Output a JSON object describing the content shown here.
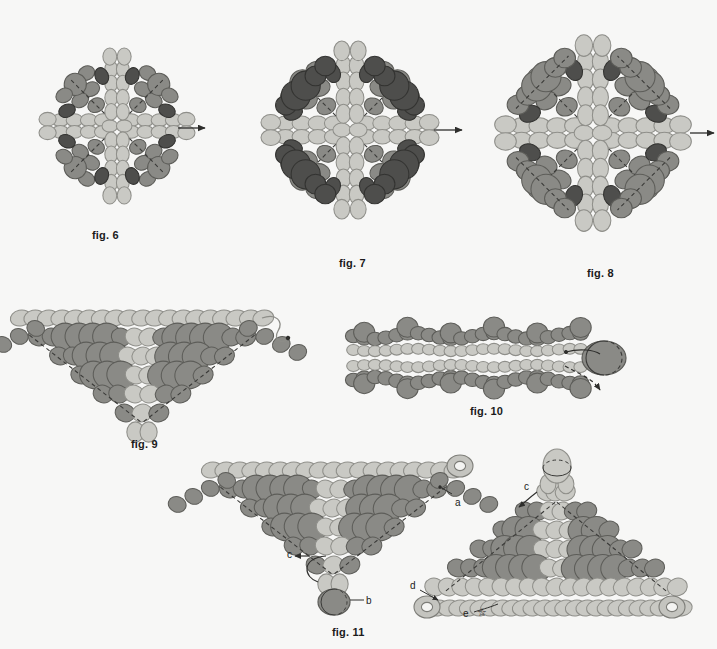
{
  "page": {
    "background_color": "#f7f7f6",
    "kind": "beadwork-instruction-diagram",
    "figure_count": 6
  },
  "palette": {
    "bead_light": "#c9c9c4",
    "bead_light_stroke": "#8f8f8a",
    "bead_medium": "#8a8a86",
    "bead_medium_stroke": "#5d5d59",
    "bead_dark": "#4e4e4c",
    "bead_dark_stroke": "#333331",
    "bead_pale": "#d9d9d4",
    "thread_color": "#3a3a38",
    "label_color": "#1b1b1b"
  },
  "figures": [
    {
      "id": "fig6",
      "label": "fig. 6",
      "shape": "diamond",
      "label_x": 92,
      "label_y": 229,
      "center_x": 117,
      "center_y": 126,
      "size": 100,
      "has_exit_arrow": true,
      "arrow_side": "right",
      "description": "Small beaded diamond with light center, medium accent beads and dark corner beads; working thread exits right."
    },
    {
      "id": "fig7",
      "label": "fig. 7",
      "shape": "diamond",
      "label_x": 339,
      "label_y": 257,
      "center_x": 350,
      "center_y": 130,
      "size": 118,
      "has_exit_arrow": true,
      "arrow_side": "right",
      "description": "Diamond enlarged by a round of large dark beads around the outer edge; thread exits right."
    },
    {
      "id": "fig8",
      "label": "fig. 8",
      "shape": "diamond",
      "label_x": 587,
      "label_y": 267,
      "center_x": 593,
      "center_y": 133,
      "size": 128,
      "has_exit_arrow": true,
      "arrow_side": "right",
      "description": "Largest diamond with a full outer round added; medium-grey field, dark accents at the points."
    },
    {
      "id": "fig9",
      "label": "fig. 9",
      "shape": "triangle",
      "label_x": 131,
      "label_y": 438,
      "center_x": 145,
      "center_y": 355,
      "width": 250,
      "height": 105,
      "has_thread_tail": true,
      "description": "Flattened triangle (half-diamond) with a light top row and a loose thread tail curling off the right end."
    },
    {
      "id": "fig10",
      "label": "fig. 10",
      "shape": "strip",
      "label_x": 470,
      "label_y": 405,
      "center_x": 495,
      "center_y": 358,
      "width": 300,
      "height": 80,
      "has_end_bead": true,
      "has_exit_arrow": true,
      "description": "Long horizontal beaded band (side view) with a large dark end bead and a thread arrow leaving downward."
    },
    {
      "id": "fig11",
      "label": "fig. 11",
      "shape": "two-triangles",
      "label_x": 332,
      "label_y": 626,
      "description": "Two joined triangles: left triangle with labels a, b, c; right triangle with labels c, d, e and ring beads."
    }
  ],
  "callouts": [
    {
      "id": "a",
      "text": "a",
      "x": 455,
      "y": 497,
      "figure": "fig11",
      "note": "ring bead at top right of left triangle"
    },
    {
      "id": "b",
      "text": "b",
      "x": 357,
      "y": 601,
      "figure": "fig11",
      "note": "large dark bead at bottom tip of left triangle"
    },
    {
      "id": "c1",
      "text": "c",
      "x": 287,
      "y": 556,
      "figure": "fig11",
      "note": "thread exit on left triangle"
    },
    {
      "id": "c2",
      "text": "c",
      "x": 525,
      "y": 489,
      "figure": "fig11",
      "note": "matching thread entry on right triangle"
    },
    {
      "id": "d",
      "text": "d",
      "x": 412,
      "y": 585,
      "figure": "fig11",
      "note": "ring bead at left tip of right triangle"
    },
    {
      "id": "e",
      "text": "e",
      "x": 481,
      "y": 613,
      "figure": "fig11",
      "note": "star-marked bead on bottom row of right triangle"
    }
  ],
  "markers": {
    "star_glyph": "☆"
  }
}
